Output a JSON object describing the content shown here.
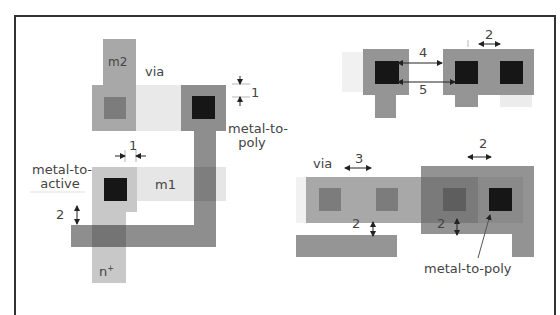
{
  "figure": {
    "colors": {
      "m2": "#a8a8a8",
      "m1": "#e6e6e6",
      "poly": "#8e8e8e",
      "active": "#c8c8c8",
      "contact": "#161616",
      "via": "#7c7c7c",
      "overlap": "#7a7a7a"
    }
  },
  "left_diagram": {
    "labels": {
      "m2": "m2",
      "via": "via",
      "spacing_top": "1",
      "metal_to_poly_line1": "metal-to-",
      "metal_to_poly_line2": "poly",
      "spacing_mid": "1",
      "metal_to_active_line1": "metal-to-",
      "metal_to_active_line2": "active",
      "m1": "m1",
      "spacing_left": "2",
      "n_plus": "n",
      "n_plus_sup": "+"
    }
  },
  "right_top_diagram": {
    "labels": {
      "spacing_contacts": "2",
      "spacing_poly_contact": "4",
      "spacing_active_contact": "5"
    }
  },
  "right_bottom_diagram": {
    "labels": {
      "via": "via",
      "spacing_vias": "3",
      "spacing_metal": "2",
      "spacing_left": "2",
      "spacing_right": "2",
      "metal_to_poly": "metal-to-poly"
    }
  }
}
